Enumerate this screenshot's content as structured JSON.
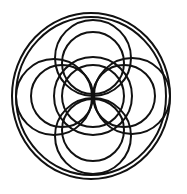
{
  "diagram": {
    "type": "geometric-circle-pattern",
    "width": 187,
    "height": 194,
    "background": "#ffffff",
    "stroke_color": "#111111",
    "stroke_width": 2,
    "outer_rings": [
      {
        "name": "outer-ring-large",
        "cx": 91,
        "cy": 96,
        "rx": 79,
        "ry": 83
      },
      {
        "name": "outer-ring-small",
        "cx": 91,
        "cy": 96,
        "rx": 75,
        "ry": 79
      }
    ],
    "circles": [
      {
        "name": "center-circle-large",
        "cx": 93,
        "cy": 96,
        "r": 39
      },
      {
        "name": "center-circle-small",
        "cx": 93,
        "cy": 96,
        "r": 31
      },
      {
        "name": "top-circle-large",
        "cx": 93,
        "cy": 58,
        "r": 38
      },
      {
        "name": "top-circle-small",
        "cx": 93,
        "cy": 63,
        "r": 31
      },
      {
        "name": "bottom-circle-large",
        "cx": 93,
        "cy": 136,
        "r": 38
      },
      {
        "name": "bottom-circle-small",
        "cx": 93,
        "cy": 130,
        "r": 31
      },
      {
        "name": "left-circle-large",
        "cx": 54,
        "cy": 97,
        "r": 38
      },
      {
        "name": "left-circle-small",
        "cx": 62,
        "cy": 96,
        "r": 31
      },
      {
        "name": "right-circle-large",
        "cx": 132,
        "cy": 96,
        "r": 38
      },
      {
        "name": "right-circle-small",
        "cx": 124,
        "cy": 96,
        "r": 31
      }
    ]
  }
}
